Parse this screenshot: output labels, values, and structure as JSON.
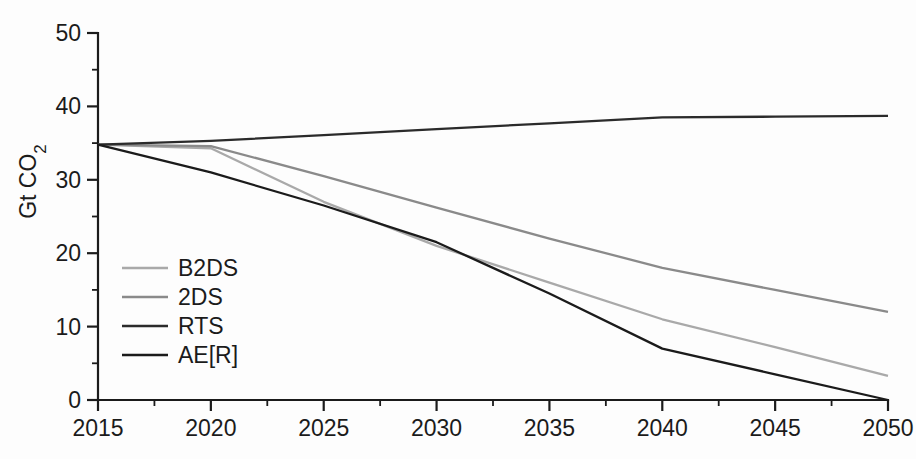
{
  "chart_data": {
    "type": "line",
    "title": "",
    "xlabel": "",
    "ylabel": "Gt CO",
    "ylabel_sub": "2",
    "xlim": [
      2015,
      2050
    ],
    "ylim": [
      0,
      50
    ],
    "grid": false,
    "legend_position": "inside-left",
    "x_ticks": [
      "2015",
      "2020",
      "2025",
      "2030",
      "2035",
      "2040",
      "2045",
      "2050"
    ],
    "x_tick_values": [
      2015,
      2020,
      2025,
      2030,
      2035,
      2040,
      2045,
      2050
    ],
    "x_minor_values": [
      2017.5,
      2022.5,
      2027.5,
      2032.5,
      2037.5,
      2042.5,
      2047.5
    ],
    "y_ticks": [
      "0",
      "10",
      "20",
      "30",
      "40",
      "50"
    ],
    "y_tick_values": [
      0,
      10,
      20,
      30,
      40,
      50
    ],
    "y_minor_values": [
      5,
      15,
      25,
      35,
      45
    ],
    "x": [
      2015,
      2020,
      2025,
      2030,
      2035,
      2040,
      2045,
      2050
    ],
    "series": [
      {
        "name": "B2DS",
        "color": "#a9a9a9",
        "values": [
          34.8,
          34.3,
          27.0,
          21.0,
          16.0,
          11.0,
          7.2,
          3.3
        ]
      },
      {
        "name": "2DS",
        "color": "#8a8a8a",
        "values": [
          34.8,
          34.6,
          30.5,
          26.2,
          22.0,
          18.0,
          15.0,
          12.0
        ]
      },
      {
        "name": "RTS",
        "color": "#2b2b2b",
        "values": [
          34.8,
          35.3,
          36.1,
          36.9,
          37.7,
          38.5,
          38.6,
          38.7
        ]
      },
      {
        "name": "AE[R]",
        "color": "#1b1b1b",
        "values": [
          34.8,
          31.0,
          26.5,
          21.5,
          14.5,
          7.0,
          3.5,
          0.0
        ]
      }
    ]
  },
  "legend": {
    "entries": [
      {
        "label": "B2DS",
        "color": "#a9a9a9"
      },
      {
        "label": "2DS",
        "color": "#8a8a8a"
      },
      {
        "label": "RTS",
        "color": "#2b2b2b"
      },
      {
        "label": "AE[R]",
        "color": "#1b1b1b"
      }
    ]
  }
}
